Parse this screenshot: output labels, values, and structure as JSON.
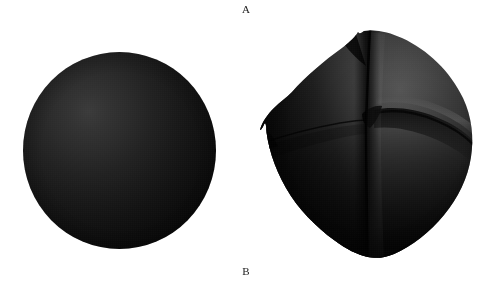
{
  "figure": {
    "background_color": "#ffffff",
    "width": 496,
    "height": 284,
    "labels": {
      "top": "A",
      "bottom": "B"
    }
  },
  "panels": [
    {
      "id": "panel-a",
      "label": "A",
      "label_position": "top",
      "object_name": "smooth-sphere",
      "description": "Smooth uniform dark sphere",
      "bounds": {
        "x": 23,
        "y": 52,
        "width": 193,
        "height": 197
      },
      "center": {
        "x": 119,
        "y": 150
      },
      "radius": 97,
      "surface": "smooth",
      "crease_count": 0,
      "colors": {
        "highlight": "#3a3a3a",
        "midtone": "#1a1a1a",
        "shadow": "#030303",
        "rim": "#020202"
      },
      "highlight_position": {
        "x_pct": 34,
        "y_pct": 30
      }
    },
    {
      "id": "panel-b",
      "label": "B",
      "label_position": "bottom",
      "object_name": "creased-sphere",
      "description": "Sphere with radial creases and folds",
      "bounds": {
        "x": 258,
        "y": 26,
        "width": 216,
        "height": 234
      },
      "center": {
        "x": 367,
        "y": 145
      },
      "radius": 104,
      "surface": "creased",
      "crease_count": 4,
      "colors": {
        "highlight": "#555555",
        "midtone": "#2e2e2e",
        "shadow": "#0a0a0a",
        "crease_line": "#050505",
        "rim": "#020202"
      },
      "highlight_position": {
        "x_pct": 66,
        "y_pct": 26
      },
      "features": [
        {
          "name": "vertical-central-crease",
          "orientation": "vertical",
          "from": {
            "x": 372,
            "y": 32
          },
          "to": {
            "x": 368,
            "y": 256
          }
        },
        {
          "name": "horizontal-right-fold",
          "orientation": "horizontal",
          "from": {
            "x": 378,
            "y": 113
          },
          "to": {
            "x": 470,
            "y": 148
          }
        },
        {
          "name": "horizontal-left-crease",
          "orientation": "horizontal",
          "from": {
            "x": 265,
            "y": 135
          },
          "to": {
            "x": 366,
            "y": 120
          }
        },
        {
          "name": "top-notch",
          "orientation": "point",
          "at": {
            "x": 364,
            "y": 31
          }
        },
        {
          "name": "left-notch",
          "orientation": "point",
          "at": {
            "x": 262,
            "y": 136
          }
        },
        {
          "name": "bottom-tip",
          "orientation": "point",
          "at": {
            "x": 368,
            "y": 257
          }
        }
      ]
    }
  ]
}
